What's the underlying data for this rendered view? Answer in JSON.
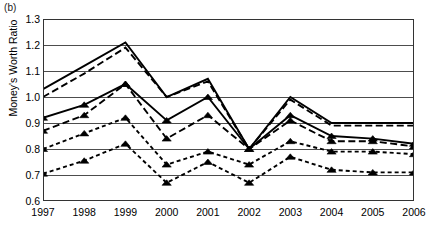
{
  "panel": {
    "label": "(b)"
  },
  "chart_data": {
    "type": "line",
    "title": "",
    "subtitle": "",
    "xlabel": "",
    "ylabel": "Money's Worth Ratio",
    "grid": true,
    "legend": "none",
    "xlim": [
      1997,
      2006
    ],
    "ylim": [
      0.6,
      1.3
    ],
    "ytick_step": 0.1,
    "categories": [
      "1997",
      "1998",
      "1999",
      "2000",
      "2001",
      "2002",
      "2003",
      "2004",
      "2005",
      "2006"
    ],
    "x": [
      1997,
      1998,
      1999,
      2000,
      2001,
      2002,
      2003,
      2004,
      2005,
      2006
    ],
    "ytick_labels": [
      "0.6",
      "0.7",
      "0.8",
      "0.9",
      "1.0",
      "1.1",
      "1.2",
      "1.3"
    ],
    "ytick_values": [
      0.6,
      0.7,
      0.8,
      0.9,
      1.0,
      1.1,
      1.2,
      1.3
    ],
    "series": [
      {
        "name": "series-1-solid-upper",
        "style": "solid",
        "marker": "none",
        "color": "#000000",
        "values": [
          1.03,
          1.12,
          1.21,
          1.0,
          1.07,
          0.8,
          1.0,
          0.9,
          0.9,
          0.9
        ]
      },
      {
        "name": "series-2-longdash-upper",
        "style": "long-dash",
        "marker": "none",
        "color": "#000000",
        "values": [
          1.0,
          1.09,
          1.19,
          1.0,
          1.06,
          0.8,
          0.99,
          0.89,
          0.89,
          0.89
        ]
      },
      {
        "name": "series-3-solid-triangle",
        "style": "solid",
        "marker": "triangle",
        "color": "#000000",
        "values": [
          0.92,
          0.97,
          1.05,
          0.91,
          1.0,
          0.8,
          0.93,
          0.85,
          0.84,
          0.82
        ]
      },
      {
        "name": "series-4-longdash-triangle",
        "style": "long-dash",
        "marker": "triangle",
        "color": "#000000",
        "values": [
          0.87,
          0.93,
          1.05,
          0.84,
          0.93,
          0.8,
          0.91,
          0.83,
          0.83,
          0.81
        ]
      },
      {
        "name": "series-5-shortdash-triangle",
        "style": "short-dash",
        "marker": "triangle",
        "color": "#000000",
        "values": [
          0.8,
          0.86,
          0.92,
          0.74,
          0.79,
          0.74,
          0.83,
          0.79,
          0.79,
          0.78
        ]
      },
      {
        "name": "series-6-shortdash-triangle-lower",
        "style": "short-dash",
        "marker": "triangle",
        "color": "#000000",
        "values": [
          0.705,
          0.755,
          0.82,
          0.67,
          0.75,
          0.67,
          0.77,
          0.72,
          0.71,
          0.71
        ]
      }
    ]
  }
}
